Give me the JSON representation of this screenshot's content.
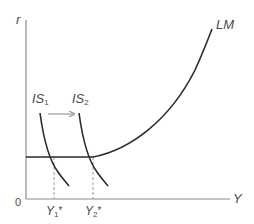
{
  "diagram": {
    "type": "IS-LM liquidity trap diagram",
    "axes": {
      "y_label": "r",
      "x_label": "Y",
      "origin_label": "0"
    },
    "curves": {
      "lm": {
        "label": "LM"
      },
      "is1": {
        "label_main": "IS",
        "label_sub": "1"
      },
      "is2": {
        "label_main": "IS",
        "label_sub": "2"
      }
    },
    "shift_arrow": {
      "direction": "right"
    },
    "equilibria": [
      {
        "label_main": "Y",
        "label_sub": "1",
        "label_sup": "*"
      },
      {
        "label_main": "Y",
        "label_sub": "2",
        "label_sup": "*"
      }
    ],
    "colors": {
      "curve": "#2b2b2b",
      "axis": "#8a8a8a",
      "arrow": "#9a9a9a",
      "dashed": "#9a9a9a",
      "text": "#4a4a4a"
    }
  }
}
